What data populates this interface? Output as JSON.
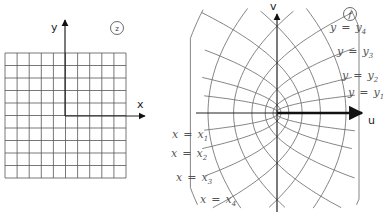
{
  "z_plane": {
    "label": "z",
    "x_axis_label": "x",
    "y_axis_label": "y",
    "grid_cells_x": 10,
    "grid_cells_y": 10
  },
  "w_plane": {
    "label": "f",
    "u_axis_label": "u",
    "v_axis_label": "v",
    "y_curves": [
      {
        "lhs": "y",
        "eq": "=",
        "rhs": "y",
        "sub": "4"
      },
      {
        "lhs": "y",
        "eq": "=",
        "rhs": "y",
        "sub": "3"
      },
      {
        "lhs": "y",
        "eq": "=",
        "rhs": "y",
        "sub": "2"
      },
      {
        "lhs": "y",
        "eq": "=",
        "rhs": "y",
        "sub": "1"
      }
    ],
    "x_curves": [
      {
        "lhs": "x",
        "eq": "=",
        "rhs": "x",
        "sub": "1"
      },
      {
        "lhs": "x",
        "eq": "=",
        "rhs": "x",
        "sub": "2"
      },
      {
        "lhs": "x",
        "eq": "=",
        "rhs": "x",
        "sub": "3"
      },
      {
        "lhs": "x",
        "eq": "=",
        "rhs": "x",
        "sub": "4"
      }
    ]
  }
}
